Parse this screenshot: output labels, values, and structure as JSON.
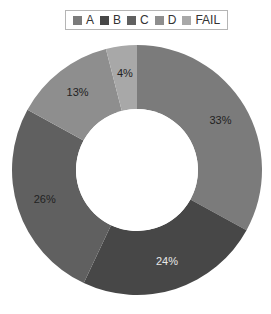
{
  "chart_data": {
    "type": "pie",
    "variant": "donut",
    "title": "",
    "legend_position": "top",
    "categories": [
      "A",
      "B",
      "C",
      "D",
      "FAIL"
    ],
    "values": [
      33,
      24,
      26,
      13,
      4
    ],
    "labels": [
      "33%",
      "24%",
      "26%",
      "13%",
      "4%"
    ],
    "colors": [
      "#7b7b7b",
      "#474747",
      "#606060",
      "#8e8e8e",
      "#a8a8a8"
    ],
    "label_light": [
      false,
      true,
      false,
      false,
      false
    ]
  }
}
